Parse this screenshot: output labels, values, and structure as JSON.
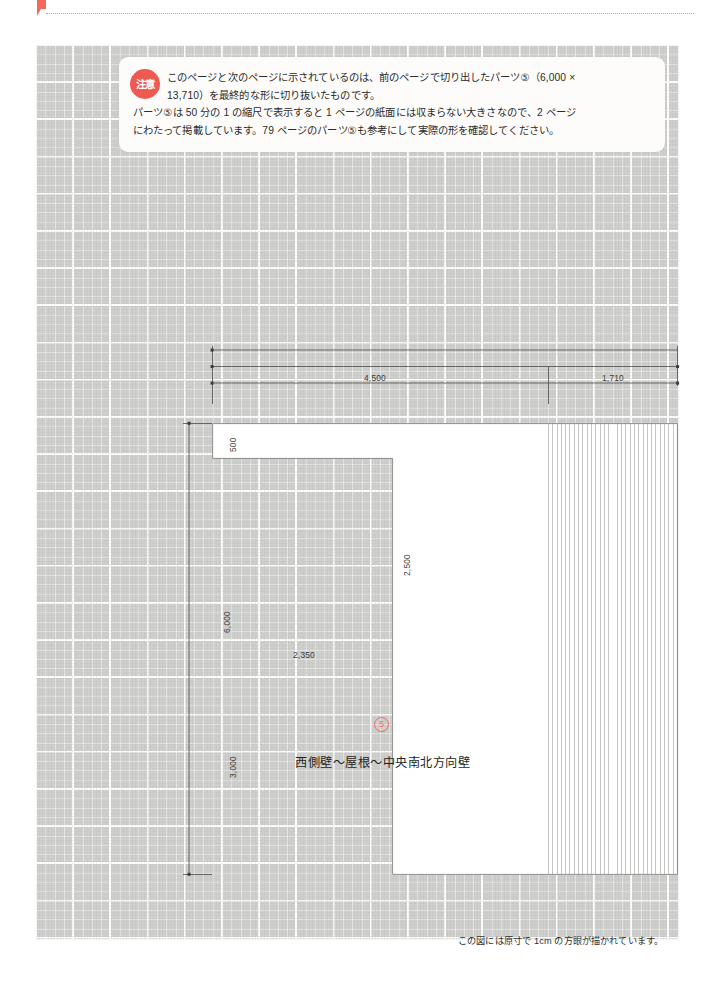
{
  "page": {
    "header_marker": "triangle-red",
    "header_faint_text": ""
  },
  "notice": {
    "badge": "注意",
    "badge_color": "#ee5a52",
    "line1": "このページと次のページに示されているのは、前のページで切り出したパーツ⑤（6,000 ×",
    "line2": "13,710）を最終的な形に切り抜いたものです。",
    "line3": "パーツ⑤は 50 分の 1 の縮尺で表示すると 1 ページの紙面には収まらない大きさなので、2 ページ",
    "line4": "にわたって掲載しています。79 ページのパーツ⑤も参考にして実際の形を確認してください。"
  },
  "drawing": {
    "dimensions": {
      "top_left": "4,500",
      "top_right": "1,710",
      "left_overall": "6,000",
      "notch_height": "500",
      "notch_depth": "2,500",
      "notch_width": "2,350",
      "lower_height": "3,000"
    },
    "part_number": "⑤",
    "part_number_color": "#ef6a62",
    "part_caption": "西側壁〜屋根〜中央南北方向壁"
  },
  "footer": {
    "note": "この図には原寸で 1cm の方眼が描かれています。"
  }
}
